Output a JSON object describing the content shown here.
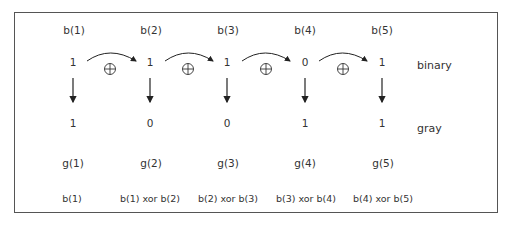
{
  "diagram": {
    "columns": [
      {
        "bit_label": "b(1)",
        "binary": "1",
        "gray": "1",
        "gray_label": "g(1)",
        "formula": "b(1)"
      },
      {
        "bit_label": "b(2)",
        "binary": "1",
        "gray": "0",
        "gray_label": "g(2)",
        "formula": "b(1) xor b(2)"
      },
      {
        "bit_label": "b(3)",
        "binary": "1",
        "gray": "0",
        "gray_label": "g(3)",
        "formula": "b(2) xor b(3)"
      },
      {
        "bit_label": "b(4)",
        "binary": "0",
        "gray": "1",
        "gray_label": "g(4)",
        "formula": "b(3) xor b(4)"
      },
      {
        "bit_label": "b(5)",
        "binary": "1",
        "gray": "1",
        "gray_label": "g(5)",
        "formula": "b(4) xor b(5)"
      }
    ],
    "row_labels": {
      "binary": "binary",
      "gray": "gray"
    },
    "xor_symbol": "⊕",
    "colors": {
      "stroke": "#333333",
      "border": "#555555",
      "text": "#333333"
    }
  }
}
